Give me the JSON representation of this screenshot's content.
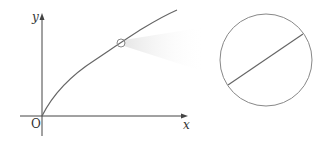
{
  "diagram": {
    "title": "",
    "labels": {
      "y_axis": "y",
      "x_axis": "x",
      "origin": "O"
    },
    "curve": {
      "description": "increasing concave curve from origin",
      "color": "#666666"
    },
    "magnifier": {
      "small_circle_color": "#888888",
      "large_circle_color": "#888888",
      "wedge_color": "#eeeeee",
      "description": "zoomed-in view of curve appears as a straight line"
    },
    "colors": {
      "axis": "#444444",
      "text": "#333333"
    }
  }
}
